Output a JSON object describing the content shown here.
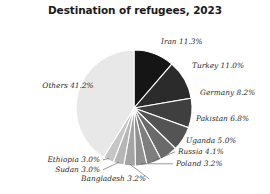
{
  "chart": {
    "title": "Destination of refugees, 2023"
  },
  "chart_data": {
    "type": "pie",
    "title": "Destination of refugees, 2023",
    "xlabel": "",
    "ylabel": "",
    "unit": "percent",
    "legend": "none",
    "labels_format": "{name} {value}%",
    "start_angle_deg": 0,
    "direction": "clockwise",
    "categories": [
      "Iran",
      "Turkey",
      "Germany",
      "Pakistan",
      "Uganda",
      "Russia",
      "Poland",
      "Bangladesh",
      "Sudan",
      "Ethiopia",
      "Others"
    ],
    "values": [
      11.3,
      11.0,
      8.2,
      6.8,
      5.0,
      4.1,
      3.2,
      3.2,
      3.0,
      3.0,
      41.2
    ],
    "colors": [
      "#151515",
      "#2b2b2b",
      "#3f3f3f",
      "#545454",
      "#6a6a6a",
      "#7e7e7e",
      "#919191",
      "#a4a4a4",
      "#b6b6b6",
      "#c6c6c6",
      "#e8e8e8"
    ],
    "slices": [
      {
        "name": "Iran",
        "value": 11.3,
        "label": "Iran 11.3%",
        "color": "#151515"
      },
      {
        "name": "Turkey",
        "value": 11.0,
        "label": "Turkey 11.0%",
        "color": "#2b2b2b"
      },
      {
        "name": "Germany",
        "value": 8.2,
        "label": "Germany 8.2%",
        "color": "#3f3f3f"
      },
      {
        "name": "Pakistan",
        "value": 6.8,
        "label": "Pakistan 6.8%",
        "color": "#545454"
      },
      {
        "name": "Uganda",
        "value": 5.0,
        "label": "Uganda 5.0%",
        "color": "#6a6a6a"
      },
      {
        "name": "Russia",
        "value": 4.1,
        "label": "Russia 4.1%",
        "color": "#7e7e7e"
      },
      {
        "name": "Poland",
        "value": 3.2,
        "label": "Poland 3.2%",
        "color": "#919191"
      },
      {
        "name": "Bangladesh",
        "value": 3.2,
        "label": "Bangladesh 3.2%",
        "color": "#a4a4a4"
      },
      {
        "name": "Sudan",
        "value": 3.0,
        "label": "Sudan 3.0%",
        "color": "#b6b6b6"
      },
      {
        "name": "Ethiopia",
        "value": 3.0,
        "label": "Ethiopia 3.0%",
        "color": "#c6c6c6"
      },
      {
        "name": "Others",
        "value": 41.2,
        "label": "Others 41.2%",
        "color": "#e8e8e8"
      }
    ]
  }
}
